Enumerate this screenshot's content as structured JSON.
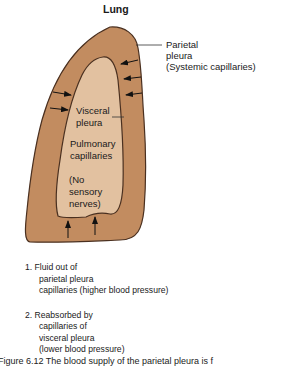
{
  "title": "Lung",
  "colors": {
    "parietal_fill": "#c28c60",
    "visceral_fill": "#e2c1a0",
    "outline": "#4a3020",
    "arrow": "#111111"
  },
  "labels": {
    "parietal": [
      "Parietal",
      "pleura",
      "(Systemic capillaries)"
    ],
    "visceral": [
      "Visceral",
      "pleura"
    ],
    "pulmonary": [
      "Pulmonary",
      "capillaries"
    ],
    "no_nerves": [
      "(No",
      "sensory",
      "nerves)"
    ]
  },
  "steps": [
    {
      "number": "1.",
      "lines": [
        "Fluid out of",
        "parietal pleura",
        "capillaries (higher blood pressure)"
      ]
    },
    {
      "number": "2.",
      "lines": [
        "Reabsorbed by",
        "capillaries of",
        "visceral pleura",
        "(lower blood pressure)"
      ]
    }
  ],
  "caption": "Figure 6.12 The blood supply of the parietal pleura is f"
}
